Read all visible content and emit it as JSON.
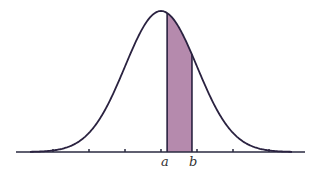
{
  "chart_data": {
    "type": "area",
    "title": "",
    "xlabel": "",
    "ylabel": "",
    "distribution": "normal",
    "tick_count": 7,
    "ticks_sigma": [
      -3,
      -2,
      -1,
      0,
      1,
      2,
      3
    ],
    "shaded_region": {
      "from_label": "a",
      "to_label": "b",
      "from_sigma": 0.17,
      "to_sigma": 0.86
    },
    "annotations": [
      {
        "text": "a",
        "position_sigma": 0.17
      },
      {
        "text": "b",
        "position_sigma": 0.86
      }
    ],
    "grid": false,
    "legend": null
  },
  "labels": {
    "a": "a",
    "b": "b"
  },
  "colors": {
    "curve": "#2a2240",
    "fill": "#b58aad",
    "axis": "#2a2a40"
  }
}
